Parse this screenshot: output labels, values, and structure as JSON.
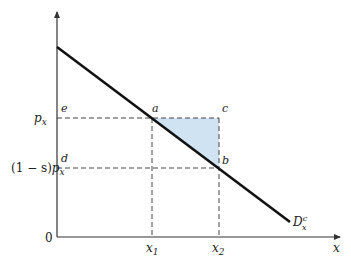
{
  "diagram": {
    "type": "demand-curve-subsidy",
    "axes": {
      "origin_label": "0",
      "x_axis_label": "x",
      "y_axis_label": ""
    },
    "y_ticks": [
      {
        "label": "p_x",
        "main": "p",
        "sub": "x",
        "prefix": ""
      },
      {
        "label": "(1 − s)p_x",
        "main": "p",
        "sub": "x",
        "prefix": "(1 − s)"
      }
    ],
    "x_ticks": [
      {
        "label": "x_1",
        "main": "x",
        "sub": "1"
      },
      {
        "label": "x_2",
        "main": "x",
        "sub": "2"
      }
    ],
    "points": {
      "a": "a",
      "b": "b",
      "c": "c",
      "d": "d",
      "e": "e"
    },
    "curve": {
      "name": "D_x^c",
      "main": "D",
      "sup": "c",
      "sub": "x"
    },
    "colors": {
      "shaded_triangle": "#cfe3f3",
      "curve": "#111111",
      "axis": "#333333",
      "dashed": "#444444"
    }
  }
}
